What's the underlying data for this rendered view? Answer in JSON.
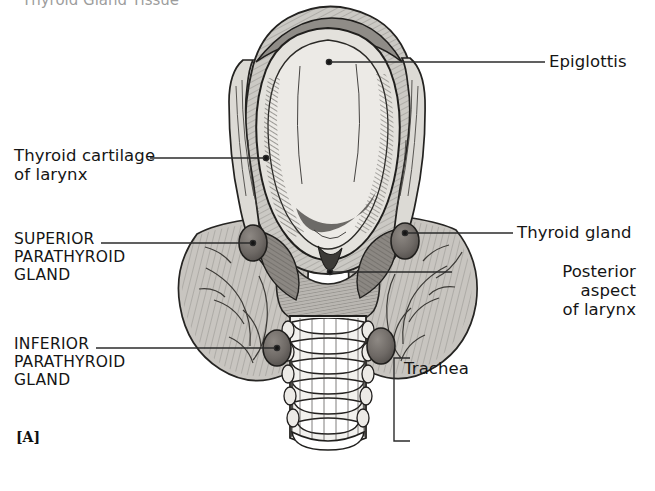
{
  "figure": {
    "panel_letter": "[A]",
    "partial_top_heading": "Thyroid Gland Tissue",
    "view": "Posterior view of the larynx, thyroid gland, parathyroid glands and trachea"
  },
  "labels": [
    {
      "id": "epiglottis",
      "text": "Epiglottis",
      "style": "mixed",
      "align": "left",
      "x": 549,
      "y": 52
    },
    {
      "id": "thyroid-cartilage",
      "text": "Thyroid cartilage\nof larynx",
      "style": "mixed",
      "align": "left",
      "x": 14,
      "y": 146
    },
    {
      "id": "superior-parathyroid",
      "text": "SUPERIOR\nPARATHYROID\nGLAND",
      "style": "caps",
      "align": "left",
      "x": 14,
      "y": 231
    },
    {
      "id": "thyroid-gland",
      "text": "Thyroid gland",
      "style": "mixed",
      "align": "left",
      "x": 517,
      "y": 223
    },
    {
      "id": "posterior-aspect",
      "text": "Posterior\naspect\nof larynx",
      "style": "mixed",
      "align": "right",
      "x": 456,
      "y": 262
    },
    {
      "id": "inferior-parathyroid",
      "text": "INFERIOR\nPARATHYROID\nGLAND",
      "style": "caps",
      "align": "left",
      "x": 14,
      "y": 336
    },
    {
      "id": "trachea",
      "text": "Trachea",
      "style": "mixed",
      "align": "left",
      "x": 404,
      "y": 359
    }
  ],
  "leaders": [
    {
      "id": "leader-epiglottis",
      "from": [
        545,
        62
      ],
      "to": [
        329,
        62
      ],
      "dot_at": "to"
    },
    {
      "id": "leader-thyroid-cartilage",
      "from": [
        150,
        158
      ],
      "to": [
        266,
        158
      ],
      "dot_at": "to"
    },
    {
      "id": "leader-superior-parathyroid",
      "from": [
        101,
        243
      ],
      "to": [
        253,
        243
      ],
      "dot_at": "to"
    },
    {
      "id": "leader-thyroid-gland",
      "from": [
        513,
        233
      ],
      "to": [
        405,
        233
      ],
      "dot_at": "to"
    },
    {
      "id": "leader-posterior-aspect",
      "from": [
        452,
        272
      ],
      "to": [
        330,
        272
      ],
      "dot_at": "to"
    },
    {
      "id": "leader-inferior-parathyroid",
      "from": [
        96,
        348
      ],
      "to": [
        277,
        348
      ],
      "dot_at": "to"
    },
    {
      "id": "leader-trachea-bracket",
      "bracket": {
        "x": 394,
        "y_top": 358,
        "y_bottom": 441,
        "tick": 16
      }
    }
  ],
  "anatomy": {
    "structures": [
      {
        "name": "epiglottis",
        "note": "large ovoid cartilage plate, upper centre"
      },
      {
        "name": "thyroid-cartilage-of-larynx",
        "note": "paired lamina flanking the epiglottis"
      },
      {
        "name": "posterior-aspect-of-larynx",
        "note": "midline posterior laryngeal surface"
      },
      {
        "name": "thyroid-gland",
        "note": "bilobed gland wrapping the larynx and upper trachea"
      },
      {
        "name": "superior-parathyroid-gland",
        "note": "upper pair of dark oval glands"
      },
      {
        "name": "inferior-parathyroid-gland",
        "note": "lower pair of dark oval glands"
      },
      {
        "name": "trachea",
        "note": "segmented cartilage rings descending in midline"
      }
    ]
  },
  "colors": {
    "background": "#ffffff",
    "ink": "#151515",
    "tissue_light": "#cfcdc8",
    "tissue_mid": "#a9a7a1",
    "tissue_dark": "#7d7b76",
    "gland_dark": "#6f6a66",
    "cartilage_pale": "#e6e4df",
    "leader_line": "#2b2b2b"
  }
}
